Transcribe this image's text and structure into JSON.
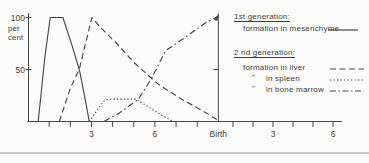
{
  "legend": {
    "group1": {
      "heading": "1st generation:",
      "items": [
        {
          "prefix": "",
          "label": "formation in mesenchyme",
          "style": "solid"
        }
      ]
    },
    "group2": {
      "heading": "2 nd generation:",
      "items": [
        {
          "prefix": "",
          "label": "formation in liver",
          "style": "dashed"
        },
        {
          "prefix": "\"",
          "label": "in spleen",
          "style": "dotted"
        },
        {
          "prefix": "\"",
          "label": "in bone marrow",
          "style": "dashdot"
        }
      ]
    }
  },
  "chart_data": {
    "type": "line",
    "title": "",
    "ylabel_lines": [
      "per",
      "cent"
    ],
    "ylim": [
      0,
      100
    ],
    "y_ticks": [
      {
        "value": 100,
        "label": "100"
      },
      {
        "value": 50,
        "label": "50"
      }
    ],
    "x_axis": {
      "prenatal_tick_months": [
        1,
        2,
        3,
        4,
        5,
        6,
        7,
        8
      ],
      "prenatal_labels": [
        {
          "month": 3,
          "text": "3"
        },
        {
          "month": 6,
          "text": "6"
        }
      ],
      "birth_label": "Birth",
      "postnatal_tick_months": [
        1,
        2,
        3,
        4,
        5,
        6
      ],
      "postnatal_labels": [
        {
          "month": 3,
          "text": "3"
        },
        {
          "month": 6,
          "text": "6"
        }
      ]
    },
    "series": [
      {
        "name": "formation in mesenchyme",
        "generation": "1st",
        "style": "solid",
        "points": [
          [
            0.48,
            0
          ],
          [
            0.8,
            62
          ],
          [
            1.05,
            100
          ],
          [
            1.65,
            100
          ],
          [
            2.1,
            72
          ],
          [
            2.45,
            48
          ],
          [
            2.75,
            16
          ],
          [
            2.9,
            0
          ]
        ]
      },
      {
        "name": "formation in liver",
        "generation": "2nd",
        "style": "dashed",
        "points": [
          [
            1.48,
            0
          ],
          [
            2.0,
            32
          ],
          [
            2.42,
            50
          ],
          [
            3.02,
            100
          ],
          [
            3.5,
            89
          ],
          [
            4.1,
            77
          ],
          [
            5.05,
            56
          ],
          [
            6.15,
            36
          ],
          [
            7.3,
            21
          ],
          [
            8.2,
            11
          ],
          [
            8.92,
            2
          ]
        ]
      },
      {
        "name": "formation in spleen",
        "generation": "2nd",
        "style": "dotted",
        "points": [
          [
            2.9,
            0
          ],
          [
            3.55,
            19
          ],
          [
            3.8,
            21.5
          ],
          [
            5.1,
            21.5
          ],
          [
            6.0,
            10
          ],
          [
            6.85,
            0
          ]
        ]
      },
      {
        "name": "formation in bone marrow",
        "generation": "2nd",
        "style": "dashdot",
        "end_marker": "arrow",
        "points": [
          [
            3.6,
            0
          ],
          [
            4.3,
            8
          ],
          [
            5.2,
            21
          ],
          [
            5.8,
            40
          ],
          [
            6.5,
            68
          ],
          [
            7.3,
            79
          ],
          [
            8.4,
            95
          ],
          [
            8.97,
            101
          ]
        ]
      }
    ]
  }
}
